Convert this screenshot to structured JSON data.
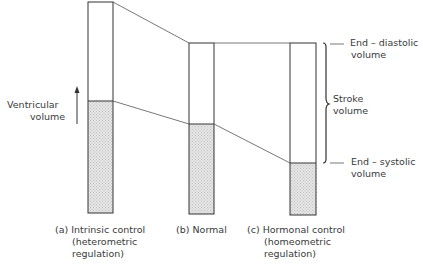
{
  "axis": {
    "label_line1": "Ventricular",
    "label_line2": "volume",
    "arrow": "up-arrow"
  },
  "bars": [
    {
      "id": "a",
      "caption_line1": "(a) Intrinsic control",
      "caption_line2": "(heterometric",
      "caption_line3": "regulation)",
      "x": 88,
      "width": 25,
      "top": 2,
      "boundary": 101,
      "bottom": 213
    },
    {
      "id": "b",
      "caption_line1": "(b) Normal",
      "x": 189,
      "width": 25,
      "top": 43,
      "boundary": 124,
      "bottom": 214
    },
    {
      "id": "c",
      "caption_line1": "(c) Hormonal control",
      "caption_line2": "(homeometric",
      "caption_line3": "regulation)",
      "x": 290,
      "width": 26,
      "top": 43,
      "boundary": 163,
      "bottom": 215
    }
  ],
  "annotations": {
    "edv_line1": "End – diastolic",
    "edv_line2": "volume",
    "sv_line1": "Stroke",
    "sv_line2": "volume",
    "esv_line1": "End – systolic",
    "esv_line2": "volume"
  },
  "colors": {
    "stroke": "#333333",
    "fill": "#dcdcdc",
    "text": "#3a3a3a"
  }
}
